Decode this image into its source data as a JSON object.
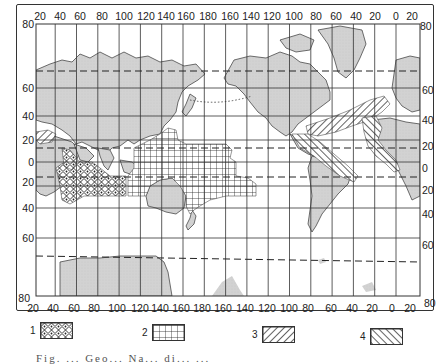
{
  "map": {
    "title": "",
    "projection": "mercator-like world map, Pacific-centred",
    "top_longitude_labels": [
      "20",
      "40",
      "60",
      "80",
      "100",
      "120",
      "140",
      "160",
      "180",
      "160",
      "140",
      "120",
      "100",
      "80",
      "60",
      "40",
      "20",
      "0",
      "20"
    ],
    "bottom_longitude_labels": [
      "20",
      "40",
      "60",
      "80",
      "100",
      "120",
      "140",
      "160",
      "180",
      "160",
      "140",
      "120",
      "100",
      "80",
      "60",
      "40",
      "20",
      "0",
      "20"
    ],
    "left_latitude_labels": [
      "80",
      "60",
      "40",
      "20",
      "0",
      "20",
      "40",
      "60",
      "80"
    ],
    "right_latitude_labels": [
      "80",
      "60",
      "40",
      "20",
      "0",
      "20",
      "40",
      "60",
      "80"
    ],
    "colors": {
      "land": "#d4d4d4",
      "grid": "#333333",
      "frame": "#333333",
      "hatch": "#222222",
      "background": "#ffffff"
    },
    "dashed_lines": [
      "Arctic circle (~66N)",
      "Tropic of Cancer (~23N)",
      "Tropic of Capricorn (~23S)",
      "Antarctic circle (~66S)"
    ]
  },
  "legend": {
    "items": [
      {
        "number": "1",
        "pattern": "cross-hatched (diamond lattice)",
        "region": "Indian Ocean / Arabian Sea"
      },
      {
        "number": "2",
        "pattern": "square grid",
        "region": "Western & Central Pacific"
      },
      {
        "number": "3",
        "pattern": "diagonal lines (/)",
        "region": "North Atlantic belt"
      },
      {
        "number": "4",
        "pattern": "diagonal lines (\\)",
        "region": "Atlantic / Caribbean belt"
      }
    ]
  },
  "caption": {
    "text": "Fig. ... Geo... Na... di... ..."
  }
}
